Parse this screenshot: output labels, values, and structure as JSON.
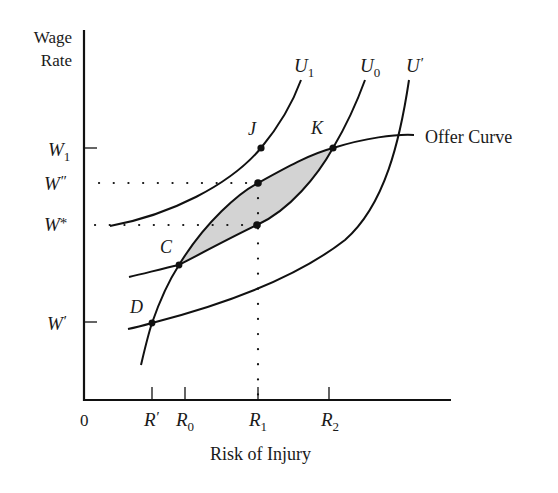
{
  "diagram": {
    "y_axis_label_line1": "Wage",
    "y_axis_label_line2": "Rate",
    "x_axis_label": "Risk of Injury",
    "origin_label": "0",
    "x_ticks": [
      {
        "main": "R",
        "sup": "′",
        "sub": ""
      },
      {
        "main": "R",
        "sup": "",
        "sub": "0"
      },
      {
        "main": "R",
        "sup": "",
        "sub": "1"
      },
      {
        "main": "R",
        "sup": "",
        "sub": "2"
      }
    ],
    "y_ticks": [
      {
        "main": "W",
        "sup": "",
        "sub": "1"
      },
      {
        "main": "W",
        "sup": "″",
        "sub": ""
      },
      {
        "main": "W",
        "sup": "*",
        "sub": ""
      },
      {
        "main": "W",
        "sup": "′",
        "sub": ""
      }
    ],
    "curves": [
      {
        "main": "U",
        "sub": "1",
        "sup": ""
      },
      {
        "main": "U",
        "sub": "0",
        "sup": ""
      },
      {
        "main": "U",
        "sub": "",
        "sup": "′"
      }
    ],
    "offer_curve_label": "Offer Curve",
    "points": [
      "J",
      "K",
      "C",
      "D"
    ],
    "shaded_region": "Area between offer curve and U0 from C to K",
    "colors": {
      "line": "#111111",
      "shade": "#d3d3d3",
      "text": "#1a1a1a"
    }
  }
}
